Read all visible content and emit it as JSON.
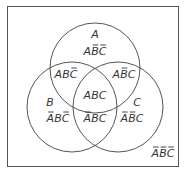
{
  "diagram": {
    "type": "venn-3",
    "colors": {
      "stroke": "#555555",
      "text": "#333333",
      "background": "#ffffff"
    },
    "frame": {
      "x": 7,
      "y": 6,
      "w": 171,
      "h": 160
    },
    "circles": [
      {
        "name": "A",
        "cx": 95,
        "cy": 68,
        "r": 45
      },
      {
        "name": "B",
        "cx": 72,
        "cy": 107,
        "r": 45
      },
      {
        "name": "C",
        "cx": 118,
        "cy": 107,
        "r": 45
      }
    ],
    "set_labels": {
      "A": {
        "text": "A",
        "x": 95,
        "y": 38
      },
      "B": {
        "text": "B",
        "x": 50,
        "y": 106
      },
      "C": {
        "text": "C",
        "x": 137,
        "y": 106
      }
    },
    "regions": [
      {
        "id": "A-only",
        "letters": [
          "A",
          "B",
          "C"
        ],
        "bars": [
          false,
          true,
          true
        ],
        "x": 95,
        "y": 55
      },
      {
        "id": "AB",
        "letters": [
          "A",
          "B",
          "C"
        ],
        "bars": [
          false,
          false,
          true
        ],
        "x": 66,
        "y": 78
      },
      {
        "id": "AC",
        "letters": [
          "A",
          "B",
          "C"
        ],
        "bars": [
          false,
          true,
          false
        ],
        "x": 124,
        "y": 78
      },
      {
        "id": "ABC",
        "letters": [
          "A",
          "B",
          "C"
        ],
        "bars": [
          false,
          false,
          false
        ],
        "x": 95,
        "y": 99
      },
      {
        "id": "B-only",
        "letters": [
          "A",
          "B",
          "C"
        ],
        "bars": [
          true,
          false,
          true
        ],
        "x": 58,
        "y": 122
      },
      {
        "id": "BC",
        "letters": [
          "A",
          "B",
          "C"
        ],
        "bars": [
          true,
          false,
          false
        ],
        "x": 95,
        "y": 122
      },
      {
        "id": "C-only",
        "letters": [
          "A",
          "B",
          "C"
        ],
        "bars": [
          true,
          true,
          false
        ],
        "x": 132,
        "y": 122
      },
      {
        "id": "none",
        "letters": [
          "A",
          "B",
          "C"
        ],
        "bars": [
          true,
          true,
          true
        ],
        "x": 163,
        "y": 157
      }
    ]
  }
}
